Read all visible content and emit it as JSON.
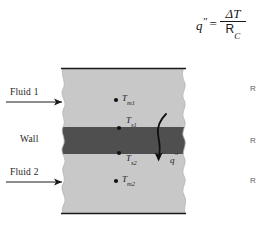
{
  "figure": {
    "type": "heat-transfer-schematic",
    "background_color": "#ffffff"
  },
  "equation": {
    "lhs": "q",
    "lhs_prime": "″",
    "equals": "=",
    "numerator": "ΔT",
    "denominator": "R",
    "denominator_subscript": "C",
    "plain_text": "q″ = ΔT / R_C"
  },
  "diagram": {
    "colors": {
      "fluid_fill": "#c8c8c8",
      "wall_fill": "#4f4f4f",
      "outline": "#141414",
      "arrow": "#1a1a1a"
    },
    "geometry": {
      "left_edge_x": 62,
      "right_edge_x": 186,
      "top_rule_y": 68,
      "bottom_rule_y": 213,
      "wall_top_y": 127,
      "wall_bottom_y": 154
    },
    "regions": [
      {
        "name": "fluid-1-region",
        "label": "Fluid 1",
        "fill": "#c8c8c8"
      },
      {
        "name": "wall-region",
        "label": "Wall",
        "fill": "#4f4f4f"
      },
      {
        "name": "fluid-2-region",
        "label": "Fluid 2",
        "fill": "#c8c8c8"
      }
    ],
    "flow_arrows": [
      {
        "name": "fluid-1-arrow",
        "label": "Fluid 1",
        "direction": "right",
        "x1": 6,
        "x2": 68,
        "y": 102
      },
      {
        "name": "fluid-2-arrow",
        "label": "Fluid 2",
        "direction": "right",
        "x1": 6,
        "x2": 68,
        "y": 182
      }
    ],
    "wall_label": "Wall",
    "temperature_points": [
      {
        "name": "T-m1",
        "base": "T",
        "subscript": "m1",
        "x": 120,
        "y": 100,
        "description": "mean temperature of fluid 1"
      },
      {
        "name": "T-s1",
        "base": "T",
        "subscript": "s1",
        "x": 124,
        "y": 128,
        "description": "wall surface temperature, side 1"
      },
      {
        "name": "T-s2",
        "base": "T",
        "subscript": "s2",
        "x": 124,
        "y": 153,
        "description": "wall surface temperature, side 2"
      },
      {
        "name": "T-m2",
        "base": "T",
        "subscript": "m2",
        "x": 120,
        "y": 181,
        "description": "mean temperature of fluid 2"
      }
    ],
    "heat_flux": {
      "name": "heat-flux-arrow",
      "label": "q",
      "label_prime": "″",
      "direction": "downward through wall",
      "label_x": 172,
      "label_y": 157
    }
  },
  "margin_labels": [
    {
      "name": "resistance-label-1",
      "text": "R",
      "y": 88
    },
    {
      "name": "resistance-label-2",
      "text": "R",
      "y": 140
    },
    {
      "name": "resistance-label-3",
      "text": "R",
      "y": 180
    }
  ]
}
